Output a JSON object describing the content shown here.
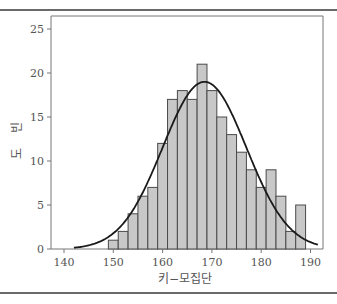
{
  "chart_data": {
    "type": "bar",
    "title": "",
    "xlabel": "키−모집단",
    "ylabel": "빈도",
    "xlim": [
      137,
      193
    ],
    "ylim": [
      0,
      26
    ],
    "xticks": [
      140,
      150,
      160,
      170,
      180,
      190
    ],
    "yticks": [
      0,
      5,
      10,
      15,
      20,
      25
    ],
    "grid": false,
    "legend": null,
    "bin_width": 2,
    "bin_starts": [
      149,
      151,
      153,
      155,
      157,
      159,
      161,
      163,
      165,
      167,
      169,
      171,
      173,
      175,
      177,
      179,
      181,
      183,
      185,
      187
    ],
    "values": [
      1,
      2,
      4,
      6,
      7,
      12,
      17,
      18,
      17,
      21,
      18,
      15,
      13,
      11,
      9,
      7,
      9,
      6,
      2,
      5
    ],
    "overlay": {
      "type": "normal_curve",
      "mean": 168.5,
      "peak": 19,
      "sd": 8.5,
      "x_range": [
        142,
        193
      ]
    },
    "colors": {
      "bar_fill": "#c8c8c8",
      "bar_edge": "#4a4a4a",
      "curve": "#1a1a1a",
      "axis": "#777777"
    }
  }
}
